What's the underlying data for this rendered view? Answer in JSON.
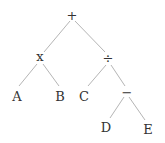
{
  "diagram": {
    "type": "expression-tree",
    "nodes": {
      "root": "+",
      "mul": "x",
      "div": "÷",
      "a": "A",
      "b": "B",
      "c": "C",
      "sub": "−",
      "d": "D",
      "e": "E"
    },
    "edges": [
      [
        "+",
        "x"
      ],
      [
        "+",
        "÷"
      ],
      [
        "x",
        "A"
      ],
      [
        "x",
        "B"
      ],
      [
        "÷",
        "C"
      ],
      [
        "÷",
        "−"
      ],
      [
        "−",
        "D"
      ],
      [
        "−",
        "E"
      ]
    ],
    "line_color": "#b0b0b0"
  }
}
